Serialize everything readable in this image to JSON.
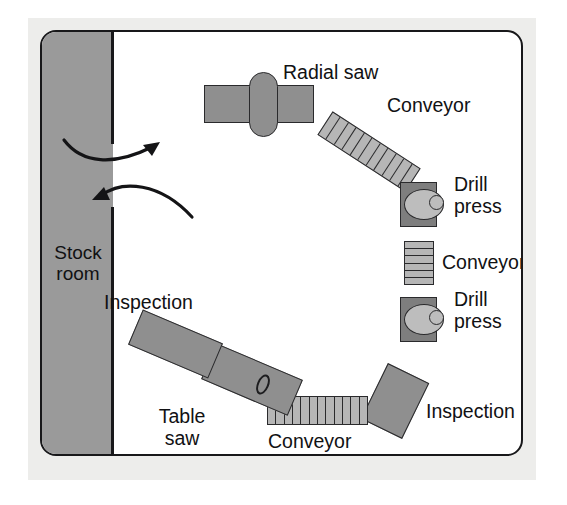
{
  "diagram": {
    "colors": {
      "paper_border": "#ededeb",
      "plan_background": "#ffffff",
      "outline": "#18181a",
      "stock_room_fill": "#9a9a9a",
      "machine_fill": "#8f8f8f",
      "conveyor_fill": "#b6b6b6",
      "drill_base_fill": "#7e7e7e",
      "drill_table_fill": "#bdbdbd"
    },
    "rooms": [
      {
        "id": "stock-room",
        "label": "Stock\nroom",
        "line1": "Stock",
        "line2": "room"
      }
    ],
    "stations": [
      {
        "id": "radial-saw",
        "label": "Radial saw",
        "type": "saw"
      },
      {
        "id": "conveyor-top",
        "label": "Conveyor",
        "type": "conveyor",
        "rungs": 11,
        "orientation": "diagonal"
      },
      {
        "id": "drill-press-1",
        "label": "Drill\npress",
        "line1": "Drill",
        "line2": "press",
        "type": "drill-press"
      },
      {
        "id": "conveyor-mid",
        "label": "Conveyor",
        "type": "conveyor",
        "rungs": 6,
        "orientation": "vertical"
      },
      {
        "id": "drill-press-2",
        "label": "Drill\npress",
        "line1": "Drill",
        "line2": "press",
        "type": "drill-press"
      },
      {
        "id": "inspection-right",
        "label": "Inspection",
        "type": "inspection"
      },
      {
        "id": "conveyor-bottom",
        "label": "Conveyor",
        "type": "conveyor",
        "rungs": 12,
        "orientation": "horizontal"
      },
      {
        "id": "table-saw",
        "label": "Table\nsaw",
        "line1": "Table",
        "line2": "saw",
        "type": "saw"
      },
      {
        "id": "inspection-left",
        "label": "Inspection",
        "type": "inspection"
      }
    ],
    "flow_arrows": [
      {
        "id": "arrow-out",
        "direction": "out-of-stock-room",
        "points_to": "upper-right"
      },
      {
        "id": "arrow-in",
        "direction": "into-stock-room",
        "points_to": "left"
      }
    ]
  }
}
